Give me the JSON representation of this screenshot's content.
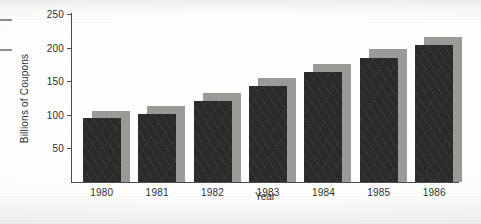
{
  "chart_data": {
    "type": "bar",
    "title": "",
    "xlabel": "Year",
    "ylabel": "Billions of Coupons",
    "categories": [
      "1980",
      "1981",
      "1982",
      "1983",
      "1984",
      "1985",
      "1986"
    ],
    "series": [
      {
        "name": "Coupons distributed",
        "role": "foreground-dark-bar",
        "color": "#2a2a29",
        "values": [
          95,
          101,
          120,
          143,
          163,
          185,
          204
        ]
      },
      {
        "name": "Backdrop block",
        "role": "offset-gray-shadow-bar",
        "color": "#9a9a97",
        "values": [
          106,
          113,
          133,
          155,
          176,
          198,
          216
        ]
      }
    ],
    "values": [
      95,
      101,
      120,
      143,
      163,
      185,
      204
    ],
    "ylim": [
      0,
      250
    ],
    "yticks": [
      50,
      100,
      150,
      200,
      250
    ],
    "ytick_labels": [
      "50",
      "100",
      "150",
      "200",
      "250"
    ],
    "grid": false,
    "legend": "none"
  },
  "artifacts": {
    "margin_dash_a": "scan-crop-rule",
    "margin_dash_b": "scan-crop-rule"
  }
}
